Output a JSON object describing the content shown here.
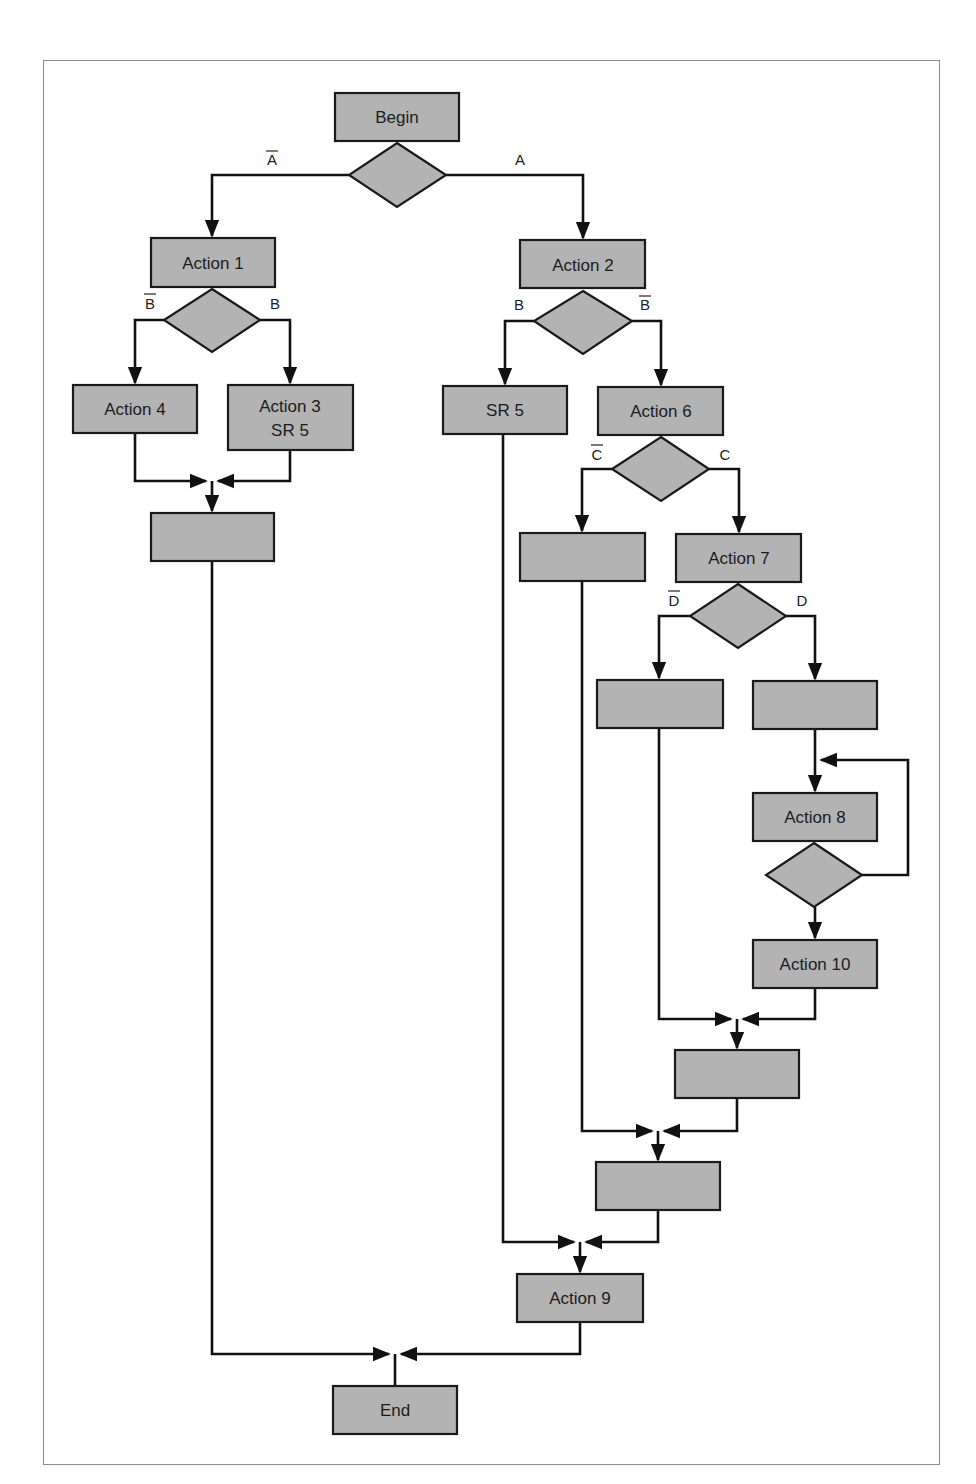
{
  "diagram": {
    "type": "flowchart",
    "nodes": {
      "begin": {
        "label": "Begin"
      },
      "action1": {
        "label": "Action 1"
      },
      "action2": {
        "label": "Action 2"
      },
      "action3": {
        "label_line1": "Action 3",
        "label_line2": "SR 5"
      },
      "action4": {
        "label": "Action 4"
      },
      "sr5": {
        "label": "SR 5"
      },
      "action6": {
        "label": "Action 6"
      },
      "action7": {
        "label": "Action 7"
      },
      "action8": {
        "label": "Action 8"
      },
      "action9": {
        "label": "Action 9"
      },
      "action10": {
        "label": "Action 10"
      },
      "end": {
        "label": "End"
      },
      "blank_left": {
        "label": ""
      },
      "blank_c_not": {
        "label": ""
      },
      "blank_d_not": {
        "label": ""
      },
      "blank_d": {
        "label": ""
      },
      "blank_merge_d": {
        "label": ""
      },
      "blank_merge_c": {
        "label": ""
      }
    },
    "conditions": {
      "a_not": "A",
      "a": "A",
      "b_not_left": "B",
      "b_left": "B",
      "b_right": "B",
      "b_not_right": "B",
      "c_not": "C",
      "c": "C",
      "d_not": "D",
      "d": "D"
    },
    "condition_negated": {
      "a_not": true,
      "a": false,
      "b_not_left": true,
      "b_left": false,
      "b_right": false,
      "b_not_right": true,
      "c_not": true,
      "c": false,
      "d_not": true,
      "d": false
    },
    "colors": {
      "node_fill": "#b3b3b3",
      "stroke": "#1a1a1a",
      "frame": "#8c8c8c"
    }
  }
}
